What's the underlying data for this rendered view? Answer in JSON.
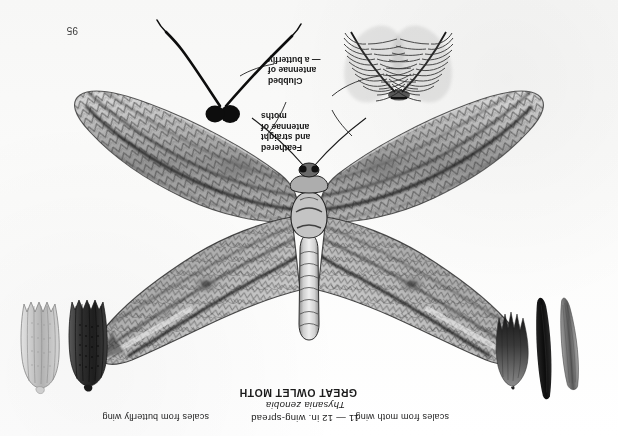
{
  "page": {
    "folio": "95",
    "orientation": "upside-down",
    "background_color": "#fdfdfd",
    "ink_color": "#1b1b1b"
  },
  "specimen": {
    "common_name": "GREAT OWLET MOTH",
    "scientific_name": "Thysania zenobia",
    "wing_spread": "11 — 12 in. wing-spread"
  },
  "captions": {
    "left_scales": "scales from moth wing",
    "right_scales": "scales from butterfly wing"
  },
  "annotations": {
    "moth_antennae": {
      "line1": "Feathered",
      "line2": "and straight",
      "line3": "antennae of",
      "line4": "moths"
    },
    "butterfly_antennae": {
      "line1": "Clubbed",
      "line2": "antennae of",
      "line3": "— a butterfly"
    }
  },
  "figures": {
    "moth_scales": [
      {
        "name": "narrow-tapered-scale",
        "shade": "#6d6d6d"
      },
      {
        "name": "dark-blade-scale",
        "shade": "#161616"
      },
      {
        "name": "fringed-fingered-scale",
        "shade": "#2c2c2c"
      }
    ],
    "butterfly_scales": [
      {
        "name": "dark-ribbed-scale",
        "shade": "#3a3a3a"
      },
      {
        "name": "pale-ribbed-scale",
        "shade": "#b9b9b9"
      }
    ],
    "antennae": [
      {
        "name": "plumose-moth-antennae",
        "type": "feathered"
      },
      {
        "name": "clubbed-butterfly-antennae",
        "type": "clubbed"
      }
    ],
    "moth_illustration": {
      "name": "great-owlet-moth-specimen",
      "tone": "grayscale-halftone"
    }
  }
}
